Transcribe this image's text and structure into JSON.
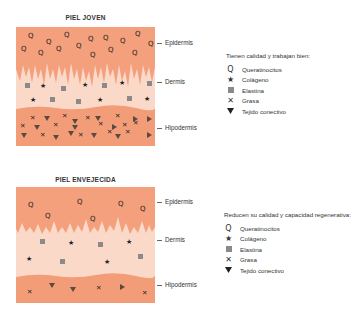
{
  "young": {
    "title": "PIEL JOVEN",
    "labels": {
      "epidermis": "Epidermis",
      "dermis": "Dermis",
      "hipodermis": "Hipodermis"
    },
    "legend_heading": "Tienen calidad y trabajan bien:"
  },
  "aged": {
    "title": "PIEL ENVEJECIDA",
    "labels": {
      "epidermis": "Epidermis",
      "dermis": "Dermis",
      "hipodermis": "Hipodermis"
    },
    "legend_heading": "Reducen su calidad y capacidad regenerativa:"
  },
  "legend_items": [
    {
      "icon": "q-icon",
      "label": "Queratinocitos"
    },
    {
      "icon": "star-icon",
      "label": "Colágeno"
    },
    {
      "icon": "square-icon",
      "label": "Elastina"
    },
    {
      "icon": "x-icon",
      "label": "Grasa"
    },
    {
      "icon": "triangle-icon",
      "label": "Tejido conectivo"
    }
  ],
  "colors": {
    "epidermis": "#f4a07c",
    "dermis": "#fbd9c9",
    "hipodermis": "#f39c78",
    "elastina": "#8a8a8a",
    "marker": "#222222",
    "triangle": "#5a4a42"
  }
}
